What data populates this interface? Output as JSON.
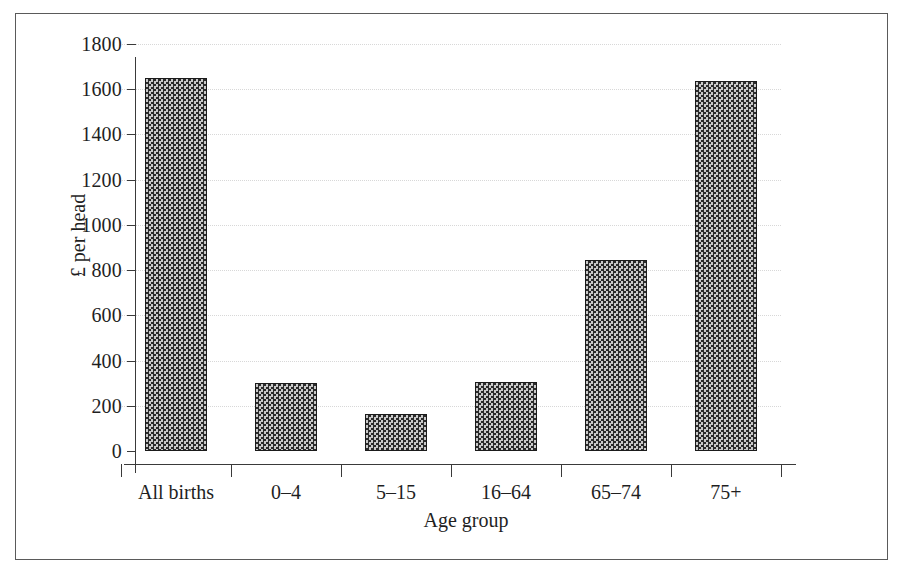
{
  "chart_data": {
    "type": "bar",
    "title": "",
    "subtitle": "",
    "xlabel": "Age group",
    "ylabel": "£ per head",
    "categories": [
      "All births",
      "0–4",
      "5–15",
      "16–64",
      "65–74",
      "75+"
    ],
    "values": [
      1650,
      300,
      165,
      305,
      845,
      1635
    ],
    "series": [
      {
        "name": "£ per head",
        "values": [
          1650,
          300,
          165,
          305,
          845,
          1635
        ]
      }
    ],
    "ylim": [
      0,
      1800
    ],
    "ytick_labels": [
      "0",
      "200",
      "400",
      "600",
      "800",
      "1000",
      "1200",
      "1400",
      "1600",
      "1800"
    ],
    "ytick_values": [
      0,
      200,
      400,
      600,
      800,
      1000,
      1200,
      1400,
      1600,
      1800
    ],
    "grid": true,
    "grid_axis": "y",
    "grid_style": "dotted",
    "legend": false,
    "legend_position": "none",
    "bar_fill": "checkered-hatch",
    "colors": {
      "bar_fill_dark": "#2b2b2b",
      "bar_fill_light": "#c9c9c9",
      "bar_border": "#1b1b1b",
      "axis": "#3a3a3a",
      "gridline": "#d8d8d8",
      "text": "#1f1f1f",
      "frame": "#5a5a5a",
      "background": "#ffffff"
    }
  }
}
